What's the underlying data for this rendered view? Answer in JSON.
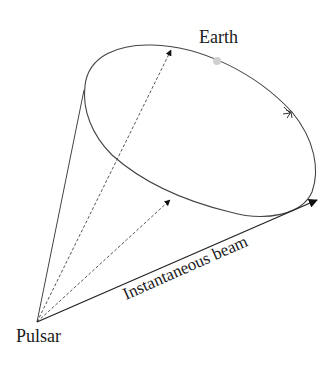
{
  "diagram": {
    "type": "pulsar-beam-geometry",
    "labels": {
      "earth": "Earth",
      "pulsar": "Pulsar",
      "beam": "Instantaneous beam"
    },
    "colors": {
      "line": "#333333",
      "earth_dot": "#cfcfcf",
      "text": "#1a1a1a"
    },
    "elements": [
      {
        "name": "cone-ellipse",
        "style": "solid",
        "note": "circular path traced by the rotating beam"
      },
      {
        "name": "cone-left-edge",
        "style": "solid"
      },
      {
        "name": "instantaneous-beam",
        "style": "solid-arrow"
      },
      {
        "name": "dashed-beam-top",
        "style": "dashed-arrow"
      },
      {
        "name": "dashed-beam-middle",
        "style": "dashed-arrow"
      },
      {
        "name": "rotation-direction-arrow",
        "style": "open-arrow"
      },
      {
        "name": "earth-dot",
        "style": "filled-circle"
      }
    ]
  }
}
